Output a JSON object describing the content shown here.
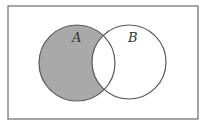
{
  "diagram": {
    "type": "venn",
    "universe": {
      "x": 8,
      "y": 6,
      "width": 190,
      "height": 113,
      "stroke": "#6a6a6a",
      "fill": "#ffffff"
    },
    "sets": [
      {
        "label": "A",
        "cx": 77,
        "cy": 63,
        "r": 38,
        "label_x": 72,
        "label_y": 42
      },
      {
        "label": "B",
        "cx": 129,
        "cy": 62,
        "r": 37,
        "label_x": 128,
        "label_y": 42
      }
    ],
    "shaded_region": "A minus B",
    "shade_color": "#a9a9a9",
    "outline_color": "#5a5a5a"
  }
}
